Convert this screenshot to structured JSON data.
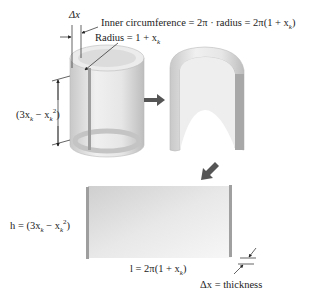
{
  "labels": {
    "delta_x": "Δx",
    "inner_circumference": "Inner circumference = 2π · radius = 2π(1 + x",
    "inner_circumference_sub": "k",
    "inner_circumference_close": ")",
    "radius": "Radius = 1 + x",
    "radius_sub": "k",
    "shell_height": "(3x",
    "shell_height_sub1": "k",
    "shell_height_mid": " − x",
    "shell_height_sub2": "k",
    "shell_height_sup": "2",
    "shell_height_close": ")",
    "slab_height_prefix": "h = (3x",
    "slab_height_sub1": "k",
    "slab_height_mid": " − x",
    "slab_height_sub2": "k",
    "slab_height_sup": "2",
    "slab_height_close": ")",
    "slab_length": "l = 2π(1 + x",
    "slab_length_sub": "k",
    "slab_length_close": ")",
    "thickness": "Δx = thickness"
  },
  "colors": {
    "shape_light": "#f2f2f2",
    "shape_mid": "#d8d8d8",
    "shape_dark": "#a8a8a8",
    "arrow": "#555555",
    "line": "#222222"
  }
}
